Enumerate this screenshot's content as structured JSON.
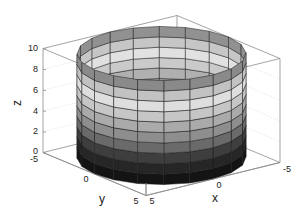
{
  "chart_data": {
    "type": "surface3d",
    "title": "",
    "surface": {
      "shape": "cylinder",
      "radius": 5,
      "z_range": [
        0,
        10
      ],
      "angular_segments": 20,
      "height_segments": 10,
      "colormap": "gray"
    },
    "axes": {
      "xlabel": "x",
      "ylabel": "y",
      "zlabel": "z",
      "xlim": [
        -5,
        5
      ],
      "ylim": [
        -5,
        5
      ],
      "zlim": [
        0,
        10
      ],
      "x_ticks": [
        "-5",
        "0",
        "5"
      ],
      "y_ticks": [
        "-5",
        "0",
        "5"
      ],
      "z_ticks": [
        "0",
        "2",
        "4",
        "6",
        "8",
        "10"
      ],
      "grid": true,
      "box": true
    },
    "band_colors": [
      "#141414",
      "#262626",
      "#3e3e3e",
      "#6a6a6a",
      "#8e8e8e",
      "#aaaaaa",
      "#c6c6c6",
      "#dedede",
      "#c2c2c2",
      "#8a8a8a"
    ]
  }
}
